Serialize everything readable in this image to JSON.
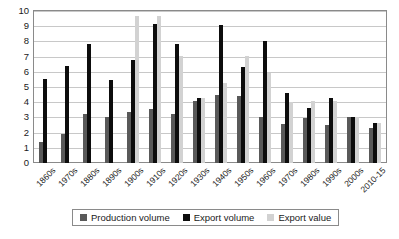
{
  "chart_data": {
    "type": "bar",
    "title": "",
    "subtitle": "",
    "xlabel": "",
    "ylabel": "",
    "ylim": [
      0,
      10
    ],
    "ytick_step": 1,
    "yticks": [
      "0",
      "1",
      "2",
      "3",
      "4",
      "5",
      "6",
      "7",
      "8",
      "9",
      "10"
    ],
    "grid": true,
    "legend_position": "bottom",
    "categories": [
      "1860s",
      "1970s",
      "1880s",
      "1890s",
      "1900s",
      "1910s",
      "1920s",
      "1930s",
      "1940s",
      "1950s",
      "1960s",
      "1970s",
      "1980s",
      "1990s",
      "2000s",
      "2010-15"
    ],
    "series": [
      {
        "name": "Production volume",
        "color": "#595959",
        "values": [
          1.35,
          1.9,
          3.25,
          3.05,
          3.35,
          3.55,
          3.25,
          4.05,
          4.45,
          4.4,
          3.05,
          2.55,
          2.95,
          2.5,
          3.0,
          2.3
        ]
      },
      {
        "name": "Export volume",
        "color": "#0d0d0d",
        "values": [
          5.55,
          6.35,
          7.8,
          5.45,
          6.75,
          9.15,
          7.8,
          4.25,
          9.05,
          6.3,
          8.05,
          4.6,
          3.6,
          4.3,
          3.05,
          2.6
        ]
      },
      {
        "name": "Export value",
        "color": "#d2d2d2",
        "values": [
          0,
          0,
          0,
          0,
          9.7,
          9.7,
          7.05,
          4.25,
          5.25,
          7.05,
          5.95,
          4.0,
          4.1,
          4.05,
          3.0,
          2.65
        ]
      }
    ]
  },
  "legend": {
    "items": [
      {
        "label": "Production volume",
        "key": "production"
      },
      {
        "label": "Export volume",
        "key": "exportvol"
      },
      {
        "label": "Export value",
        "key": "exportval"
      }
    ]
  }
}
